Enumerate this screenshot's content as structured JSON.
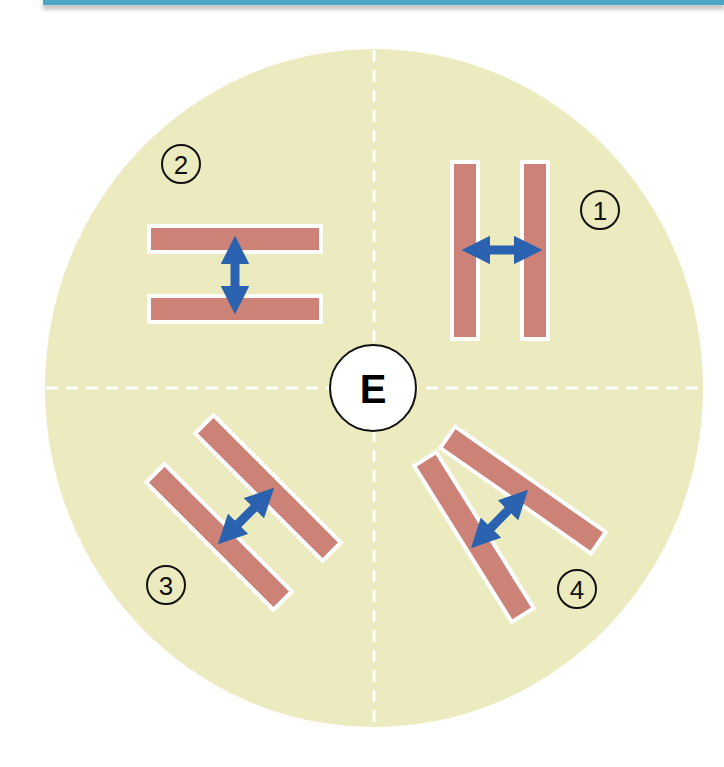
{
  "diagram": {
    "center_label": "E",
    "colors": {
      "header_bar": "#4aa8c6",
      "disc_fill": "#ecebbf",
      "bar_fill": "#cd8278",
      "bar_outline": "#ffffff",
      "arrow": "#2a62b0",
      "divider": "#ffffff",
      "label_stroke": "#111111"
    },
    "quadrants": [
      {
        "number": "1",
        "position": "top-right",
        "arrangement": "two vertical parallel bars",
        "arrow": "horizontal double-headed"
      },
      {
        "number": "2",
        "position": "top-left",
        "arrangement": "two horizontal parallel bars",
        "arrow": "vertical double-headed"
      },
      {
        "number": "3",
        "position": "bottom-left",
        "arrangement": "two diagonal parallel bars",
        "arrow": "diagonal double-headed"
      },
      {
        "number": "4",
        "position": "bottom-right",
        "arrangement": "two diverging diagonal bars",
        "arrow": "diagonal double-headed"
      }
    ]
  }
}
